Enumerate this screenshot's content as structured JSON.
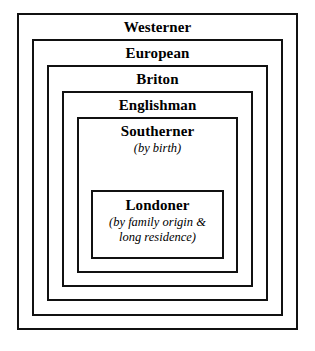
{
  "diagram": {
    "background_color": "#ffffff",
    "line_color": "#111111",
    "text_color": "#000000",
    "bands": [
      {
        "id": "westerner",
        "title": "Westerner",
        "qualifier": "",
        "left": 17,
        "top": 13,
        "width": 281,
        "height": 317
      },
      {
        "id": "european",
        "title": "European",
        "qualifier": "",
        "left": 32,
        "top": 39,
        "width": 251,
        "height": 277
      },
      {
        "id": "briton",
        "title": "Briton",
        "qualifier": "",
        "left": 47,
        "top": 65,
        "width": 221,
        "height": 236
      },
      {
        "id": "englishman",
        "title": "Englishman",
        "qualifier": "",
        "left": 62,
        "top": 91,
        "width": 191,
        "height": 196
      },
      {
        "id": "southerner",
        "title": "Southerner",
        "qualifier": "(by birth)",
        "left": 77,
        "top": 117,
        "width": 161,
        "height": 156
      },
      {
        "id": "londoner",
        "title": "Londoner",
        "qualifier": "(by family origin &\nlong residence)",
        "left": 91,
        "top": 190,
        "width": 133,
        "height": 69
      }
    ]
  }
}
